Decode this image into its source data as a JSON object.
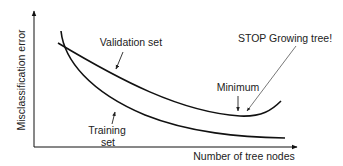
{
  "diagram": {
    "type": "error-vs-complexity curve",
    "y_axis_label": "Misclassification error",
    "x_axis_label": "Number of tree nodes",
    "curves": [
      {
        "name": "Validation set",
        "shape": "U-shaped, decreasing then rising"
      },
      {
        "name": "Training set",
        "shape": "monotonically decreasing"
      }
    ],
    "annotations": {
      "validation_label": "Validation set",
      "training_label_line1": "Training",
      "training_label_line2": "set",
      "minimum_label": "Minimum",
      "stop_label": "STOP Growing tree!"
    },
    "colors": {
      "line": "#111111",
      "text": "#222222",
      "pointer": "#555555",
      "background": "#ffffff"
    }
  }
}
